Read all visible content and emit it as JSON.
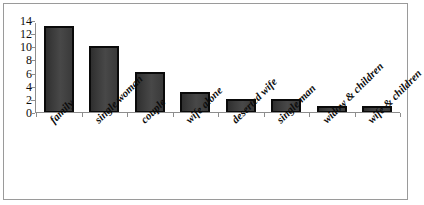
{
  "chart_data": {
    "type": "bar",
    "title": "",
    "xlabel": "",
    "ylabel": "",
    "categories": [
      "family",
      "single woman",
      "couple",
      "wife alone",
      "deserted wife",
      "single man",
      "widow & children",
      "wife & children"
    ],
    "values": [
      13.3,
      10.2,
      6.2,
      3.2,
      2.2,
      2.2,
      1.1,
      1.1
    ],
    "ylim": [
      0,
      14
    ],
    "yticks": [
      0,
      2,
      4,
      6,
      8,
      10,
      12,
      14
    ],
    "ytick_labels": [
      "0",
      "2",
      "4",
      "6",
      "8",
      "10",
      "12",
      "14"
    ],
    "grid": false,
    "legend": false,
    "legend_position": "none",
    "bar_color": "#3b3b3b",
    "bar_edge_color": "#0a0a0a",
    "axis_color": "#8d8d8d",
    "border_color": "#9a9a9a",
    "background_color": "#ffffff"
  }
}
